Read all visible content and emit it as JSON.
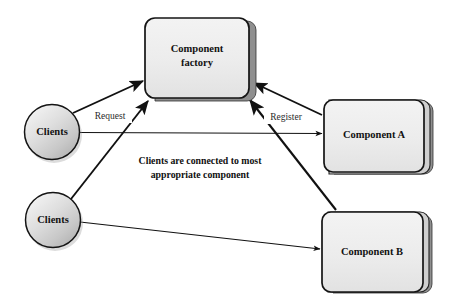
{
  "diagram": {
    "background_color": "#ffffff",
    "colors": {
      "box_fill": "#ededed",
      "box_stroke": "#1a1a1a",
      "box_shadow": "#8d8d8d",
      "circle_fill_light": "#e8e8e8",
      "circle_fill_dark": "#c6c6c6",
      "circle_stroke": "#1a1a1a",
      "arrow": "#111111",
      "text": "#121212"
    },
    "nodes": [
      {
        "id": "component-factory",
        "shape": "rounded-box-stacked",
        "label_line1": "Component",
        "label_line2": "factory",
        "x": 145,
        "y": 18,
        "width": 105,
        "height": 80
      },
      {
        "id": "clients-top",
        "shape": "circle",
        "label": "Clients",
        "cx": 52,
        "cy": 132,
        "r": 28
      },
      {
        "id": "clients-bottom",
        "shape": "circle",
        "label": "Clients",
        "cx": 53,
        "cy": 220,
        "r": 28
      },
      {
        "id": "component-a",
        "shape": "rounded-box-stacked",
        "label": "Component A",
        "x": 324,
        "y": 100,
        "width": 108,
        "height": 72
      },
      {
        "id": "component-b",
        "shape": "rounded-box-stacked",
        "label": "Component B",
        "x": 322,
        "y": 212,
        "width": 110,
        "height": 80
      }
    ],
    "edges": [
      {
        "id": "clients-top-to-factory",
        "from": "clients-top",
        "to": "component-factory",
        "label": "Request",
        "label_x": 110,
        "label_y": 116,
        "arrowhead": "end"
      },
      {
        "id": "clients-top-to-component-a",
        "from": "clients-top",
        "to": "component-a",
        "label": "",
        "arrowhead": "end"
      },
      {
        "id": "clients-bottom-to-factory",
        "from": "clients-bottom",
        "to": "component-factory",
        "label": "",
        "arrowhead": "end"
      },
      {
        "id": "clients-bottom-to-component-b",
        "from": "clients-bottom",
        "to": "component-b",
        "label": "",
        "arrowhead": "end"
      },
      {
        "id": "component-a-to-factory",
        "from": "component-a",
        "to": "component-factory",
        "label": "Register",
        "label_x": 286,
        "label_y": 117,
        "arrowhead": "end"
      },
      {
        "id": "component-b-to-factory",
        "from": "component-b",
        "to": "component-factory",
        "label": "",
        "arrowhead": "end"
      }
    ],
    "caption": {
      "line1": "Clients are connected to most",
      "line2": "appropriate component",
      "x": 200,
      "y1": 162,
      "y2": 176
    }
  }
}
